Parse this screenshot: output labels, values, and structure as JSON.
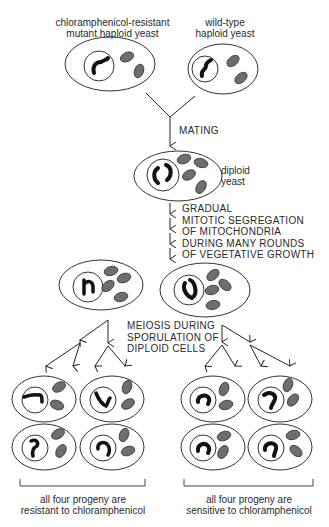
{
  "labels": {
    "mutant_parent": [
      "chloramphenicol-resistant",
      "mutant haploid yeast"
    ],
    "wildtype_parent": [
      "wild-type",
      "haploid yeast"
    ],
    "mating": "MATING",
    "diploid": [
      "diploid",
      "yeast"
    ],
    "segregation": [
      "GRADUAL",
      "MITOTIC SEGREGATION",
      "OF MITOCHONDRIA",
      "DURING MANY ROUNDS",
      "OF VEGETATIVE GROWTH"
    ],
    "meiosis": [
      "MEIOSIS DURING",
      "SPORULATION OF",
      "DIPLOID CELLS"
    ],
    "resistant_result": [
      "all four progeny are",
      "resistant to chloramphenicol"
    ],
    "sensitive_result": [
      "all four progeny are",
      "sensitive to chloramphenicol"
    ]
  },
  "colors": {
    "outline": "#333333",
    "mitochondrion": "#6e6e6e",
    "dna": "#111111"
  }
}
